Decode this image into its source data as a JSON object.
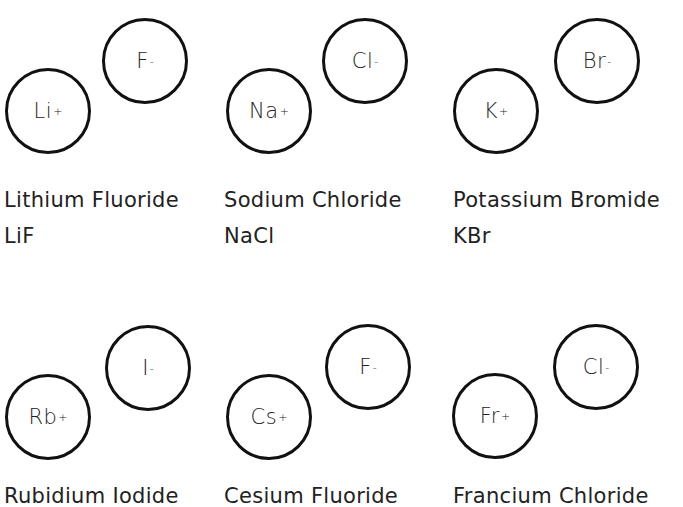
{
  "compounds": [
    {
      "name": "Lithium Fluoride",
      "formula": "LiF",
      "cation": {
        "symbol": "Li",
        "charge": "+"
      },
      "anion": {
        "symbol": "F",
        "charge": "-"
      }
    },
    {
      "name": "Sodium Chloride",
      "formula": "NaCl",
      "cation": {
        "symbol": "Na",
        "charge": "+"
      },
      "anion": {
        "symbol": "Cl",
        "charge": "-"
      }
    },
    {
      "name": "Potassium Bromide",
      "formula": "KBr",
      "cation": {
        "symbol": "K",
        "charge": "+"
      },
      "anion": {
        "symbol": "Br",
        "charge": "-"
      }
    },
    {
      "name": "Rubidium Iodide",
      "cation": {
        "symbol": "Rb",
        "charge": "+"
      },
      "anion": {
        "symbol": "I",
        "charge": "-"
      }
    },
    {
      "name": "Cesium Fluoride",
      "cation": {
        "symbol": "Cs",
        "charge": "+"
      },
      "anion": {
        "symbol": "F",
        "charge": "-"
      }
    },
    {
      "name": "Francium Chloride",
      "cation": {
        "symbol": "Fr",
        "charge": "+"
      },
      "anion": {
        "symbol": "Cl",
        "charge": "-"
      }
    }
  ]
}
